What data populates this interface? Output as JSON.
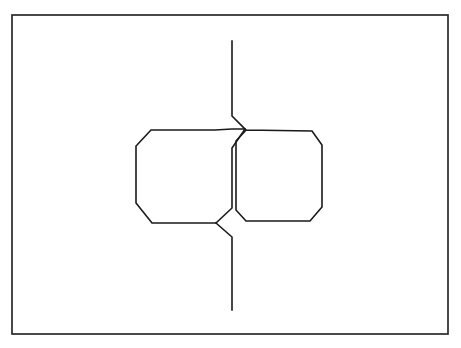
{
  "document": {
    "title": "Line drawing figure",
    "background_color": "#ffffff",
    "stroke_color": "#1a1a1a",
    "frame_color": "#2a2a2a",
    "canvas": {
      "width": 461,
      "height": 348
    }
  },
  "figure": {
    "frame": {
      "name": "outer-border",
      "x": 12,
      "y": 15,
      "width": 436,
      "height": 319,
      "stroke_width": 1.7
    },
    "paths": [
      {
        "name": "top-lead-line",
        "points": "232,41 232,116 245,129"
      },
      {
        "name": "left-octagon-outline",
        "points": "245,129 232,129 215,130 151,130 137,145 136,146 136,203 152,223 216,223 232,208 232,148 245,129"
      },
      {
        "name": "right-octagon-outline",
        "points": "246,130 312,131 322,145 322,207 310,221 246,221 236,210 236,141 246,130"
      },
      {
        "name": "bottom-lead-line",
        "points": "216,223 232,237 232,310"
      }
    ],
    "vertices": {
      "left_octagon": [
        [
          151,
          130
        ],
        [
          215,
          130
        ],
        [
          232,
          148
        ],
        [
          232,
          208
        ],
        [
          216,
          223
        ],
        [
          152,
          223
        ],
        [
          136,
          203
        ],
        [
          136,
          146
        ]
      ],
      "right_octagon": [
        [
          246,
          130
        ],
        [
          312,
          131
        ],
        [
          322,
          145
        ],
        [
          322,
          207
        ],
        [
          310,
          221
        ],
        [
          246,
          221
        ],
        [
          236,
          210
        ],
        [
          236,
          141
        ]
      ]
    }
  }
}
